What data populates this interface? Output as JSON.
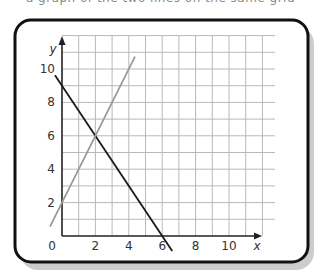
{
  "header": {
    "cut_text": "a graph of the two lines on the same grid"
  },
  "chart_data": {
    "type": "line",
    "title": "",
    "xlabel": "x",
    "ylabel": "y",
    "xlim": [
      0,
      12.8
    ],
    "ylim": [
      0,
      12
    ],
    "grid": true,
    "x_ticks": [
      0,
      2,
      4,
      6,
      8,
      10
    ],
    "y_ticks": [
      0,
      2,
      4,
      6,
      8,
      10
    ],
    "x_tick_labels": [
      "0",
      "2",
      "4",
      "6",
      "8",
      "10"
    ],
    "y_tick_labels": [
      "2",
      "4",
      "6",
      "8",
      "10"
    ],
    "origin_label": "0",
    "series": [
      {
        "name": "y = 9 - 1.5x",
        "color": "#1a1a1a",
        "points": [
          [
            -0.42,
            9.63
          ],
          [
            6.6,
            -0.9
          ]
        ]
      },
      {
        "name": "y = 2x + 2",
        "color": "#999999",
        "points": [
          [
            -0.72,
            0.56
          ],
          [
            4.37,
            10.74
          ]
        ]
      }
    ],
    "annotations": [
      {
        "text": "intersection",
        "x": 2,
        "y": 6
      }
    ]
  }
}
